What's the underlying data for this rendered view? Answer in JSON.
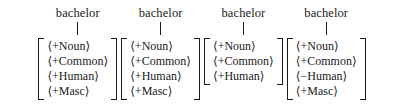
{
  "diagram": {
    "type": "feature-matrix-set",
    "entries": [
      {
        "label": "bachelor",
        "features": [
          "⟨+Noun⟩",
          "⟨+Common⟩",
          "⟨+Human⟩",
          "⟨+Masc⟩"
        ]
      },
      {
        "label": "bachelor",
        "features": [
          "⟨+Noun⟩",
          "⟨+Common⟩",
          "⟨+Human⟩",
          "⟨+Masc⟩"
        ]
      },
      {
        "label": "bachelor",
        "features": [
          "⟨+Noun⟩",
          "⟨+Common⟩",
          "⟨+Human⟩"
        ]
      },
      {
        "label": "bachelor",
        "features": [
          "⟨+Noun⟩",
          "⟨+Common⟩",
          "⟨−Human⟩",
          "⟨+Masc⟩"
        ]
      }
    ]
  },
  "colors": {
    "text": "#1a1a1a",
    "background": "#ffffff"
  }
}
